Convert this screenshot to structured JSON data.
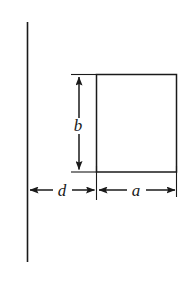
{
  "figure": {
    "type": "geometry-diagram",
    "background_color": "#ffffff",
    "stroke_color": "#1a1a1a",
    "labels": {
      "height_label": "b",
      "gap_label": "d",
      "width_label": "a"
    },
    "geometry": {
      "wall_line": {
        "x": 27,
        "y1": 22,
        "y2": 262
      },
      "rectangle": {
        "x1": 96,
        "y1": 74,
        "x2": 177,
        "y2": 172
      },
      "height_dimension": {
        "x": 79,
        "y1": 74,
        "y2": 172
      },
      "gap_dimension": {
        "y": 190,
        "x1": 28,
        "x2": 96
      },
      "width_dimension": {
        "y": 190,
        "x1": 97,
        "x2": 177
      }
    },
    "label_positions": {
      "b": {
        "x": 78,
        "y": 128
      },
      "d": {
        "x": 62,
        "y": 196
      },
      "a": {
        "x": 136,
        "y": 196
      }
    },
    "font_size": "17px"
  }
}
